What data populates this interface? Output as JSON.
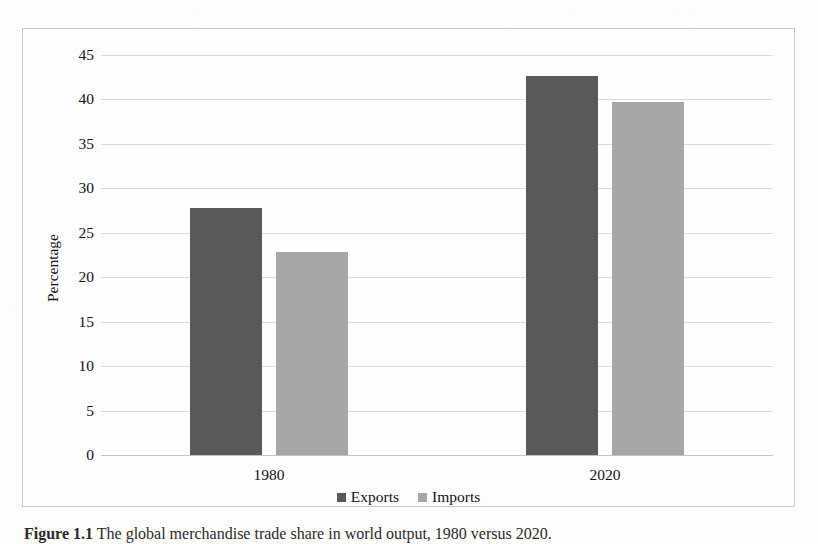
{
  "figure": {
    "caption_label": "Figure 1.1",
    "caption_text": "The global merchandise trade share in world output, 1980 versus 2020."
  },
  "chart_data": {
    "type": "bar",
    "title": "",
    "xlabel": "",
    "ylabel": "Percentage",
    "categories": [
      "1980",
      "2020"
    ],
    "series": [
      {
        "name": "Exports",
        "color": "#595959",
        "values": [
          27.8,
          42.6
        ]
      },
      {
        "name": "Imports",
        "color": "#a6a6a6",
        "values": [
          22.8,
          39.7
        ]
      }
    ],
    "ylim": [
      0,
      45
    ],
    "ytick_step": 5,
    "yticks": [
      "45",
      "40",
      "35",
      "30",
      "25",
      "20",
      "15",
      "10",
      "5",
      "0"
    ],
    "ytick_values": [
      45,
      40,
      35,
      30,
      25,
      20,
      15,
      10,
      5,
      0
    ],
    "grid": true,
    "legend_position": "bottom"
  }
}
